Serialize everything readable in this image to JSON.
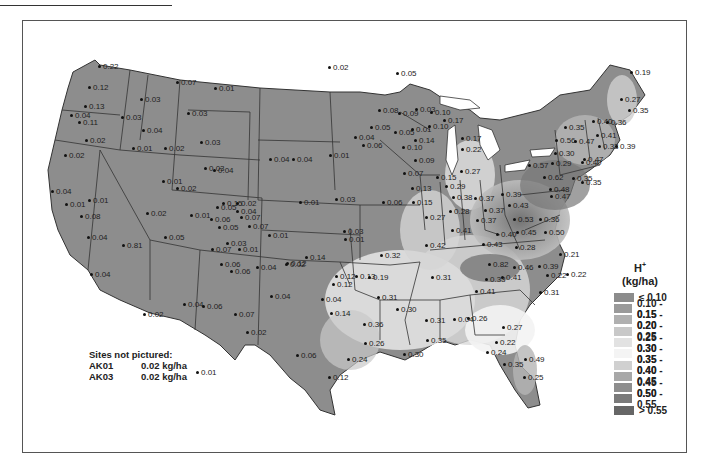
{
  "chart_data": {
    "type": "choropleth-map",
    "title": "",
    "variable": "H+",
    "units": "(kg/ha)",
    "legend": {
      "title": "H+",
      "units": "(kg/ha)",
      "position": "right",
      "classes": [
        {
          "label": "≤ 0.10",
          "color": "#8c8c8c"
        },
        {
          "label": "0.10 - 0.15",
          "color": "#9a9a9a"
        },
        {
          "label": "0.15 - 0.20",
          "color": "#b0b0b0"
        },
        {
          "label": "0.20 - 0.25",
          "color": "#c8c8c8"
        },
        {
          "label": "0.25 - 0.30",
          "color": "#e2e2e2"
        },
        {
          "label": "0.30 - 0.35",
          "color": "#f4f4f4"
        },
        {
          "label": "0.35 - 0.40",
          "color": "#d0d0d0"
        },
        {
          "label": "0.40 - 0.45",
          "color": "#a8a8a8"
        },
        {
          "label": "0.45 - 0.50",
          "color": "#8e8e8e"
        },
        {
          "label": "0.50 - 0.55",
          "color": "#7a7a7a"
        },
        {
          "label": "> 0.55",
          "color": "#666666"
        }
      ]
    },
    "sites": [
      {
        "x": 100,
        "y": 67,
        "v": "0.22"
      },
      {
        "x": 90,
        "y": 88,
        "v": "0.12"
      },
      {
        "x": 86,
        "y": 107,
        "v": "0.13"
      },
      {
        "x": 72,
        "y": 116,
        "v": "0.04"
      },
      {
        "x": 80,
        "y": 123,
        "v": "0.11"
      },
      {
        "x": 123,
        "y": 118,
        "v": "0.03"
      },
      {
        "x": 142,
        "y": 100,
        "v": "0.03"
      },
      {
        "x": 178,
        "y": 83,
        "v": "0.07"
      },
      {
        "x": 216,
        "y": 89,
        "v": "0.01"
      },
      {
        "x": 189,
        "y": 114,
        "v": "0.03"
      },
      {
        "x": 144,
        "y": 131,
        "v": "0.04"
      },
      {
        "x": 87,
        "y": 141,
        "v": "0.02"
      },
      {
        "x": 66,
        "y": 156,
        "v": "0.02"
      },
      {
        "x": 134,
        "y": 149,
        "v": "0.01"
      },
      {
        "x": 166,
        "y": 149,
        "v": "0.02"
      },
      {
        "x": 202,
        "y": 143,
        "v": "0.03"
      },
      {
        "x": 206,
        "y": 169,
        "v": "0.03"
      },
      {
        "x": 215,
        "y": 171,
        "v": "0.04"
      },
      {
        "x": 164,
        "y": 182,
        "v": "0.01"
      },
      {
        "x": 178,
        "y": 189,
        "v": "0.02"
      },
      {
        "x": 53,
        "y": 192,
        "v": "0.04"
      },
      {
        "x": 67,
        "y": 205,
        "v": "0.01"
      },
      {
        "x": 90,
        "y": 201,
        "v": "0.01"
      },
      {
        "x": 82,
        "y": 217,
        "v": "0.08"
      },
      {
        "x": 89,
        "y": 238,
        "v": "0.04"
      },
      {
        "x": 124,
        "y": 246,
        "v": "0.81"
      },
      {
        "x": 92,
        "y": 275,
        "v": "0.04"
      },
      {
        "x": 148,
        "y": 214,
        "v": "0.02"
      },
      {
        "x": 166,
        "y": 238,
        "v": "0.05"
      },
      {
        "x": 192,
        "y": 216,
        "v": "0.01"
      },
      {
        "x": 224,
        "y": 204,
        "v": "0.15"
      },
      {
        "x": 238,
        "y": 204,
        "v": "0.02"
      },
      {
        "x": 218,
        "y": 208,
        "v": "0.05"
      },
      {
        "x": 238,
        "y": 212,
        "v": "0.04"
      },
      {
        "x": 242,
        "y": 218,
        "v": "0.07"
      },
      {
        "x": 212,
        "y": 220,
        "v": "0.06"
      },
      {
        "x": 220,
        "y": 228,
        "v": "0.05"
      },
      {
        "x": 250,
        "y": 227,
        "v": "0.07"
      },
      {
        "x": 270,
        "y": 236,
        "v": "0.01"
      },
      {
        "x": 228,
        "y": 244,
        "v": "0.03"
      },
      {
        "x": 213,
        "y": 250,
        "v": "0.07"
      },
      {
        "x": 240,
        "y": 250,
        "v": "0.01"
      },
      {
        "x": 222,
        "y": 265,
        "v": "0.06"
      },
      {
        "x": 232,
        "y": 272,
        "v": "0.06"
      },
      {
        "x": 258,
        "y": 268,
        "v": "0.04"
      },
      {
        "x": 287,
        "y": 265,
        "v": "0.02"
      },
      {
        "x": 330,
        "y": 68,
        "v": "0.02"
      },
      {
        "x": 271,
        "y": 160,
        "v": "0.04"
      },
      {
        "x": 294,
        "y": 160,
        "v": "0.04"
      },
      {
        "x": 331,
        "y": 156,
        "v": "0.01"
      },
      {
        "x": 301,
        "y": 203,
        "v": "0.01"
      },
      {
        "x": 337,
        "y": 200,
        "v": "0.03"
      },
      {
        "x": 346,
        "y": 240,
        "v": "0.01"
      },
      {
        "x": 345,
        "y": 232,
        "v": "0.03"
      },
      {
        "x": 398,
        "y": 74,
        "v": "0.05"
      },
      {
        "x": 380,
        "y": 111,
        "v": "0.08"
      },
      {
        "x": 400,
        "y": 114,
        "v": "0.09"
      },
      {
        "x": 417,
        "y": 110,
        "v": "0.03"
      },
      {
        "x": 432,
        "y": 113,
        "v": "0.10"
      },
      {
        "x": 372,
        "y": 128,
        "v": "0.05"
      },
      {
        "x": 356,
        "y": 138,
        "v": "0.04"
      },
      {
        "x": 396,
        "y": 133,
        "v": "0.05"
      },
      {
        "x": 364,
        "y": 146,
        "v": "0.06"
      },
      {
        "x": 416,
        "y": 141,
        "v": "0.14"
      },
      {
        "x": 404,
        "y": 148,
        "v": "0.10"
      },
      {
        "x": 413,
        "y": 130,
        "v": "0.01"
      },
      {
        "x": 430,
        "y": 127,
        "v": "0.10"
      },
      {
        "x": 416,
        "y": 161,
        "v": "0.09"
      },
      {
        "x": 405,
        "y": 174,
        "v": "0.07"
      },
      {
        "x": 438,
        "y": 178,
        "v": "0.15"
      },
      {
        "x": 413,
        "y": 189,
        "v": "0.13"
      },
      {
        "x": 384,
        "y": 203,
        "v": "0.06"
      },
      {
        "x": 414,
        "y": 203,
        "v": "0.15"
      },
      {
        "x": 445,
        "y": 121,
        "v": "0.17"
      },
      {
        "x": 463,
        "y": 139,
        "v": "0.17"
      },
      {
        "x": 463,
        "y": 150,
        "v": "0.22"
      },
      {
        "x": 462,
        "y": 172,
        "v": "0.27"
      },
      {
        "x": 447,
        "y": 187,
        "v": "0.29"
      },
      {
        "x": 427,
        "y": 218,
        "v": "0.27"
      },
      {
        "x": 451,
        "y": 212,
        "v": "0.28"
      },
      {
        "x": 453,
        "y": 231,
        "v": "0.41"
      },
      {
        "x": 427,
        "y": 246,
        "v": "0.42"
      },
      {
        "x": 454,
        "y": 198,
        "v": "0.38"
      },
      {
        "x": 476,
        "y": 199,
        "v": "0.37"
      },
      {
        "x": 486,
        "y": 211,
        "v": "0.37"
      },
      {
        "x": 478,
        "y": 221,
        "v": "0.37"
      },
      {
        "x": 503,
        "y": 195,
        "v": "0.39"
      },
      {
        "x": 510,
        "y": 206,
        "v": "0.43"
      },
      {
        "x": 515,
        "y": 220,
        "v": "0.53"
      },
      {
        "x": 518,
        "y": 233,
        "v": "0.45"
      },
      {
        "x": 498,
        "y": 235,
        "v": "0.40"
      },
      {
        "x": 484,
        "y": 245,
        "v": "0.43"
      },
      {
        "x": 517,
        "y": 248,
        "v": "0.28"
      },
      {
        "x": 541,
        "y": 220,
        "v": "0.36"
      },
      {
        "x": 546,
        "y": 233,
        "v": "0.50"
      },
      {
        "x": 382,
        "y": 256,
        "v": "0.32"
      },
      {
        "x": 307,
        "y": 258,
        "v": "0.14"
      },
      {
        "x": 288,
        "y": 264,
        "v": "0.12"
      },
      {
        "x": 337,
        "y": 277,
        "v": "0.12"
      },
      {
        "x": 334,
        "y": 285,
        "v": "0.12"
      },
      {
        "x": 323,
        "y": 300,
        "v": "0.04"
      },
      {
        "x": 332,
        "y": 314,
        "v": "0.14"
      },
      {
        "x": 357,
        "y": 277,
        "v": "0.13"
      },
      {
        "x": 370,
        "y": 278,
        "v": "0.19"
      },
      {
        "x": 379,
        "y": 298,
        "v": "0.31"
      },
      {
        "x": 398,
        "y": 310,
        "v": "0.30"
      },
      {
        "x": 433,
        "y": 278,
        "v": "0.31"
      },
      {
        "x": 490,
        "y": 265,
        "v": "0.82"
      },
      {
        "x": 487,
        "y": 280,
        "v": "0.33"
      },
      {
        "x": 503,
        "y": 278,
        "v": "0.41"
      },
      {
        "x": 515,
        "y": 268,
        "v": "0.46"
      },
      {
        "x": 540,
        "y": 267,
        "v": "0.39"
      },
      {
        "x": 561,
        "y": 255,
        "v": "0.21"
      },
      {
        "x": 548,
        "y": 276,
        "v": "0.22"
      },
      {
        "x": 568,
        "y": 275,
        "v": "0.22"
      },
      {
        "x": 541,
        "y": 293,
        "v": "0.31"
      },
      {
        "x": 477,
        "y": 292,
        "v": "0.41"
      },
      {
        "x": 469,
        "y": 319,
        "v": "0.26"
      },
      {
        "x": 455,
        "y": 320,
        "v": "0.04"
      },
      {
        "x": 427,
        "y": 321,
        "v": "0.31"
      },
      {
        "x": 428,
        "y": 341,
        "v": "0.35"
      },
      {
        "x": 405,
        "y": 355,
        "v": "0.30"
      },
      {
        "x": 365,
        "y": 325,
        "v": "0.36"
      },
      {
        "x": 366,
        "y": 344,
        "v": "0.26"
      },
      {
        "x": 349,
        "y": 360,
        "v": "0.24"
      },
      {
        "x": 330,
        "y": 378,
        "v": "0.12"
      },
      {
        "x": 298,
        "y": 356,
        "v": "0.06"
      },
      {
        "x": 198,
        "y": 373,
        "v": "0.01"
      },
      {
        "x": 248,
        "y": 333,
        "v": "0.02"
      },
      {
        "x": 145,
        "y": 315,
        "v": "0.02"
      },
      {
        "x": 185,
        "y": 305,
        "v": "0.04"
      },
      {
        "x": 204,
        "y": 307,
        "v": "0.06"
      },
      {
        "x": 236,
        "y": 315,
        "v": "0.07"
      },
      {
        "x": 272,
        "y": 297,
        "v": "0.04"
      },
      {
        "x": 504,
        "y": 328,
        "v": "0.27"
      },
      {
        "x": 497,
        "y": 343,
        "v": "0.22"
      },
      {
        "x": 488,
        "y": 353,
        "v": "0.24"
      },
      {
        "x": 526,
        "y": 360,
        "v": "0.49"
      },
      {
        "x": 505,
        "y": 365,
        "v": "0.35"
      },
      {
        "x": 525,
        "y": 378,
        "v": "0.25"
      },
      {
        "x": 632,
        "y": 73,
        "v": "0.19"
      },
      {
        "x": 622,
        "y": 100,
        "v": "0.27"
      },
      {
        "x": 630,
        "y": 111,
        "v": "0.35"
      },
      {
        "x": 566,
        "y": 128,
        "v": "0.35"
      },
      {
        "x": 594,
        "y": 122,
        "v": "0.40"
      },
      {
        "x": 608,
        "y": 123,
        "v": "0.36"
      },
      {
        "x": 557,
        "y": 141,
        "v": "0.56"
      },
      {
        "x": 576,
        "y": 142,
        "v": "0.47"
      },
      {
        "x": 598,
        "y": 136,
        "v": "0.41"
      },
      {
        "x": 600,
        "y": 147,
        "v": "0.33"
      },
      {
        "x": 617,
        "y": 147,
        "v": "0.39"
      },
      {
        "x": 556,
        "y": 154,
        "v": "0.30"
      },
      {
        "x": 553,
        "y": 164,
        "v": "0.29"
      },
      {
        "x": 530,
        "y": 166,
        "v": "0.57"
      },
      {
        "x": 545,
        "y": 178,
        "v": "0.62"
      },
      {
        "x": 551,
        "y": 190,
        "v": "0.48"
      },
      {
        "x": 552,
        "y": 197,
        "v": "0.47"
      },
      {
        "x": 574,
        "y": 179,
        "v": "0.35"
      },
      {
        "x": 583,
        "y": 163,
        "v": "0.40"
      },
      {
        "x": 585,
        "y": 160,
        "v": "0.47"
      },
      {
        "x": 583,
        "y": 183,
        "v": "0.35"
      }
    ]
  },
  "notes": {
    "heading": "Sites not pictured:",
    "rows": [
      {
        "site": "AK01",
        "value": "0.02 kg/ha"
      },
      {
        "site": "AK03",
        "value": "0.02 kg/ha"
      }
    ]
  },
  "legend_header": {
    "title": "H",
    "sup": "+",
    "units": "(kg/ha)"
  }
}
